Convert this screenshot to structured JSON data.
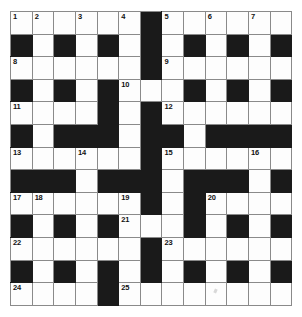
{
  "puzzle": {
    "title": "Crossword Grid",
    "columns": 13,
    "rows": 13,
    "colors": {
      "block": "#1a1a1a",
      "cell": "#fdfdfd",
      "grid_line": "#8a8a8a",
      "number": "#111111",
      "background": "#ffffff"
    },
    "legend": {
      "block_symbol": "#",
      "open_symbol": "."
    },
    "grid": [
      "......#......",
      "#.#.#.#.#.#.#",
      "......#......",
      "#.#.#...#.#.#",
      "....#.#......",
      "#.###.##.####",
      "......#......",
      "###.###.###.#",
      "......#.#....",
      "#.#.#...#.#.#",
      "......#......",
      "#.#.#.#.#.#.#",
      "....#........"
    ],
    "numbers": [
      {
        "n": "1",
        "row": 0,
        "col": 0
      },
      {
        "n": "2",
        "row": 0,
        "col": 1
      },
      {
        "n": "3",
        "row": 0,
        "col": 3
      },
      {
        "n": "4",
        "row": 0,
        "col": 5
      },
      {
        "n": "5",
        "row": 0,
        "col": 7
      },
      {
        "n": "6",
        "row": 0,
        "col": 9
      },
      {
        "n": "7",
        "row": 0,
        "col": 11
      },
      {
        "n": "8",
        "row": 2,
        "col": 0
      },
      {
        "n": "9",
        "row": 2,
        "col": 7
      },
      {
        "n": "10",
        "row": 3,
        "col": 5
      },
      {
        "n": "11",
        "row": 4,
        "col": 0
      },
      {
        "n": "12",
        "row": 4,
        "col": 7
      },
      {
        "n": "13",
        "row": 6,
        "col": 0
      },
      {
        "n": "14",
        "row": 6,
        "col": 3
      },
      {
        "n": "15",
        "row": 6,
        "col": 7
      },
      {
        "n": "16",
        "row": 6,
        "col": 11
      },
      {
        "n": "17",
        "row": 8,
        "col": 0
      },
      {
        "n": "18",
        "row": 8,
        "col": 1
      },
      {
        "n": "19",
        "row": 8,
        "col": 5
      },
      {
        "n": "20",
        "row": 8,
        "col": 9
      },
      {
        "n": "21",
        "row": 9,
        "col": 5
      },
      {
        "n": "22",
        "row": 10,
        "col": 0
      },
      {
        "n": "23",
        "row": 10,
        "col": 7
      },
      {
        "n": "24",
        "row": 12,
        "col": 0
      },
      {
        "n": "25",
        "row": 12,
        "col": 5
      }
    ]
  }
}
